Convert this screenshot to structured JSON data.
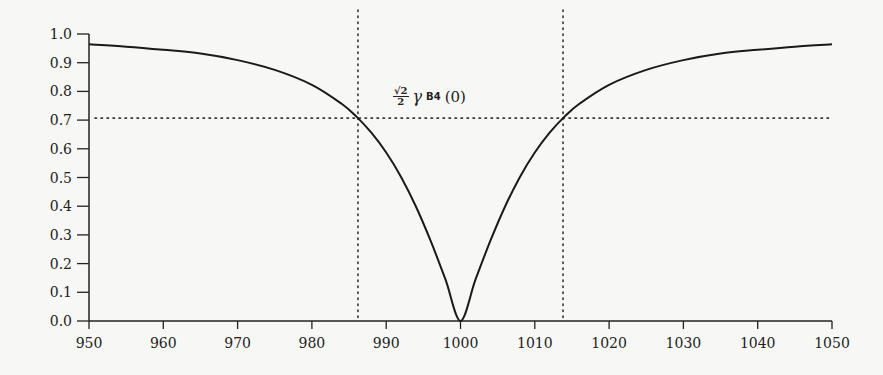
{
  "chart_data": {
    "type": "line",
    "title": "",
    "xlabel": "",
    "ylabel": "",
    "xlim": [
      950,
      1050
    ],
    "ylim": [
      0.0,
      1.0
    ],
    "x_ticks": [
      "950",
      "960",
      "970",
      "980",
      "990",
      "1000",
      "1010",
      "1020",
      "1030",
      "1040",
      "1050"
    ],
    "y_ticks": [
      "0.0",
      "0.1",
      "0.2",
      "0.3",
      "0.4",
      "0.5",
      "0.6",
      "0.7",
      "0.8",
      "0.9",
      "1.0"
    ],
    "grid": false,
    "legend": null,
    "series": [
      {
        "name": "gamma_B4 normalized",
        "x": [
          950,
          955,
          960,
          965,
          970,
          975,
          980,
          984,
          986,
          988,
          990,
          992,
          994,
          996,
          998,
          1000,
          1002,
          1004,
          1006,
          1008,
          1010,
          1012,
          1014,
          1016,
          1020,
          1025,
          1030,
          1035,
          1040,
          1045,
          1050
        ],
        "values": [
          0.964,
          0.956,
          0.945,
          0.932,
          0.909,
          0.875,
          0.823,
          0.757,
          0.712,
          0.656,
          0.587,
          0.502,
          0.399,
          0.278,
          0.143,
          0.0,
          0.143,
          0.278,
          0.399,
          0.502,
          0.587,
          0.656,
          0.712,
          0.757,
          0.823,
          0.875,
          0.909,
          0.932,
          0.945,
          0.956,
          0.964
        ]
      }
    ],
    "reference_lines": [
      {
        "orientation": "horizontal",
        "y": 0.707,
        "style": "dotted"
      },
      {
        "orientation": "vertical",
        "x": 986.2,
        "style": "dotted"
      },
      {
        "orientation": "vertical",
        "x": 1013.8,
        "style": "dotted"
      }
    ],
    "annotations": [
      {
        "text": "√2/2 γ_B4(0)",
        "x": 1000,
        "y": 0.74
      }
    ]
  },
  "annotation": {
    "num": "√2",
    "den": "2",
    "gamma": "γ",
    "sub": "B4",
    "arg": "(0)"
  }
}
